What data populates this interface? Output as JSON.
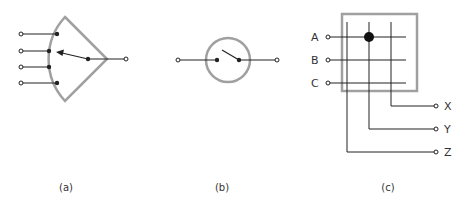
{
  "colors": {
    "frame": "#a0a0a0",
    "wire": "#222222",
    "background": "#ffffff"
  },
  "figures": [
    {
      "id": "a",
      "caption": "(a)",
      "description": "multi-position rotary selector switch: one input, four outputs"
    },
    {
      "id": "b",
      "caption": "(b)",
      "description": "single on/off switch in circle"
    },
    {
      "id": "c",
      "caption": "(c)",
      "description": "crossbar switch matrix, inputs A B C, outputs X Y Z"
    }
  ],
  "crossbar": {
    "inputs": [
      "A",
      "B",
      "C"
    ],
    "outputs": [
      "X",
      "Y",
      "Z"
    ],
    "closed_crosspoint": {
      "input": "A",
      "output": "Y"
    }
  }
}
